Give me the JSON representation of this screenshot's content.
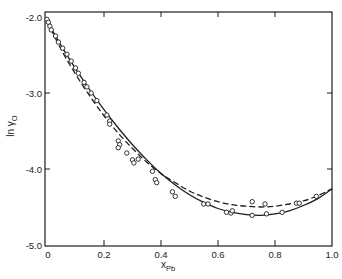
{
  "chart_data": {
    "type": "line",
    "title": "",
    "xlabel": "x_Pb",
    "ylabel": "ln γ_O",
    "xlim": [
      0.0,
      1.0
    ],
    "ylim": [
      -5.0,
      -2.0
    ],
    "grid": false,
    "legend": null,
    "x_ticks": [
      0,
      0.2,
      0.4,
      0.6,
      0.8,
      1.0
    ],
    "x_tick_labels": [
      "0",
      "0.2",
      "0.4",
      "0.6",
      "0.8",
      "1.0"
    ],
    "y_ticks": [
      -2.0,
      -3.0,
      -4.0,
      -5.0
    ],
    "y_tick_labels": [
      "-2.0",
      "-3.0",
      "-4.0",
      "-5.0"
    ],
    "series": [
      {
        "name": "experimental data",
        "style": "open-circle markers",
        "x": [
          0.0,
          0.005,
          0.01,
          0.015,
          0.03,
          0.04,
          0.055,
          0.07,
          0.085,
          0.1,
          0.11,
          0.13,
          0.14,
          0.155,
          0.175,
          0.21,
          0.22,
          0.22,
          0.25,
          0.255,
          0.25,
          0.28,
          0.3,
          0.305,
          0.32,
          0.37,
          0.38,
          0.385,
          0.44,
          0.45,
          0.55,
          0.565,
          0.63,
          0.645,
          0.65,
          0.72,
          0.72,
          0.765,
          0.77,
          0.825,
          0.875,
          0.885,
          0.945
        ],
        "values": [
          -2.03,
          -2.07,
          -2.12,
          -2.17,
          -2.25,
          -2.33,
          -2.41,
          -2.49,
          -2.58,
          -2.67,
          -2.74,
          -2.86,
          -2.92,
          -3.0,
          -3.1,
          -3.29,
          -3.37,
          -3.41,
          -3.63,
          -3.68,
          -3.72,
          -3.79,
          -3.88,
          -3.92,
          -3.87,
          -4.03,
          -4.14,
          -4.18,
          -4.3,
          -4.36,
          -4.46,
          -4.46,
          -4.57,
          -4.58,
          -4.55,
          -4.43,
          -4.61,
          -4.46,
          -4.59,
          -4.57,
          -4.45,
          -4.45,
          -4.36
        ]
      },
      {
        "name": "solid curve",
        "style": "solid line",
        "x": [
          0.0,
          0.05,
          0.1,
          0.15,
          0.2,
          0.25,
          0.3,
          0.35,
          0.4,
          0.45,
          0.5,
          0.55,
          0.6,
          0.65,
          0.7,
          0.75,
          0.8,
          0.85,
          0.9,
          0.95,
          1.0
        ],
        "values": [
          -2.05,
          -2.38,
          -2.68,
          -2.96,
          -3.22,
          -3.46,
          -3.68,
          -3.88,
          -4.06,
          -4.21,
          -4.34,
          -4.44,
          -4.52,
          -4.57,
          -4.6,
          -4.61,
          -4.59,
          -4.55,
          -4.48,
          -4.39,
          -4.26
        ]
      },
      {
        "name": "dashed curve",
        "style": "dashed line",
        "x": [
          0.0,
          0.05,
          0.1,
          0.15,
          0.2,
          0.25,
          0.3,
          0.35,
          0.4,
          0.45,
          0.5,
          0.55,
          0.6,
          0.65,
          0.7,
          0.75,
          0.8,
          0.85,
          0.9,
          0.95,
          1.0
        ],
        "values": [
          -2.05,
          -2.43,
          -2.75,
          -3.04,
          -3.3,
          -3.53,
          -3.73,
          -3.91,
          -4.06,
          -4.18,
          -4.29,
          -4.37,
          -4.43,
          -4.47,
          -4.49,
          -4.5,
          -4.49,
          -4.46,
          -4.42,
          -4.35,
          -4.26
        ]
      }
    ]
  }
}
